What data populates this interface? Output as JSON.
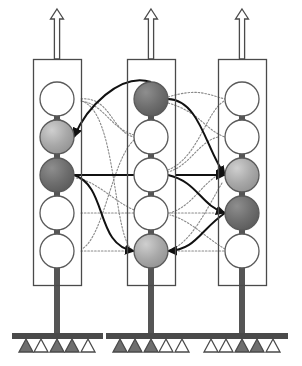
{
  "diagram": {
    "type": "node-network-diagram",
    "canvas": {
      "width": 302,
      "height": 366
    },
    "colors": {
      "outline": "#4a4a4a",
      "node_stroke": "#5a5a5a",
      "node_white": "#ffffff",
      "node_light_gray": "#a8a8a8",
      "node_dark_gray": "#6e6e6e",
      "stem": "#555555",
      "ground_bar": "#4a4a4a",
      "triangle_filled": "#6e6e6e",
      "triangle_empty": "#ffffff",
      "solid_link": "#111111",
      "dotted_link": "#8a8a8a",
      "background": "#ffffff"
    },
    "columns": [
      {
        "id": "column-1",
        "label": "left-column",
        "box": {
          "x": 33,
          "y": 59,
          "width": 48,
          "height": 226
        },
        "out_arrow": {
          "x": 57,
          "y_top": 9,
          "y_bottom": 59,
          "style": "hollow-up-arrow"
        },
        "stem": {
          "x": 57,
          "y_top": 84,
          "y_bottom": 333
        },
        "inner_arrow": {
          "x": 57,
          "y": 124,
          "direction": "up"
        },
        "nodes": [
          {
            "index": 0,
            "cy": 99,
            "fill": "white",
            "label": "c1-n1"
          },
          {
            "index": 1,
            "cy": 137,
            "fill": "light",
            "label": "c1-n2"
          },
          {
            "index": 2,
            "cy": 175,
            "fill": "dark",
            "label": "c1-n3"
          },
          {
            "index": 3,
            "cy": 213,
            "fill": "white",
            "label": "c1-n4"
          },
          {
            "index": 4,
            "cy": 251,
            "fill": "white",
            "label": "c1-n5"
          }
        ],
        "ground": {
          "bar_x": 12,
          "bar_y": 333,
          "bar_width": 91
        },
        "triangles": [
          {
            "index": 0,
            "cx": 26,
            "fill": "filled"
          },
          {
            "index": 1,
            "cx": 41,
            "fill": "empty"
          },
          {
            "index": 2,
            "cx": 57,
            "fill": "filled"
          },
          {
            "index": 3,
            "cx": 72,
            "fill": "filled"
          },
          {
            "index": 4,
            "cx": 88,
            "fill": "empty"
          }
        ]
      },
      {
        "id": "column-2",
        "label": "middle-column",
        "box": {
          "x": 127,
          "y": 59,
          "width": 48,
          "height": 226
        },
        "out_arrow": {
          "x": 151,
          "y_top": 9,
          "y_bottom": 59,
          "style": "hollow-up-arrow"
        },
        "stem": {
          "x": 151,
          "y_top": 84,
          "y_bottom": 333
        },
        "inner_arrow": {
          "x": 151,
          "y": 124,
          "direction": "up"
        },
        "nodes": [
          {
            "index": 0,
            "cy": 99,
            "fill": "dark",
            "label": "c2-n1"
          },
          {
            "index": 1,
            "cy": 137,
            "fill": "white",
            "label": "c2-n2"
          },
          {
            "index": 2,
            "cy": 175,
            "fill": "white",
            "label": "c2-n3"
          },
          {
            "index": 3,
            "cy": 213,
            "fill": "white",
            "label": "c2-n4"
          },
          {
            "index": 4,
            "cy": 251,
            "fill": "light",
            "label": "c2-n5"
          }
        ],
        "ground": {
          "bar_x": 106,
          "bar_y": 333,
          "bar_width": 91
        },
        "triangles": [
          {
            "index": 0,
            "cx": 120,
            "fill": "filled"
          },
          {
            "index": 1,
            "cx": 135,
            "fill": "filled"
          },
          {
            "index": 2,
            "cx": 151,
            "fill": "filled"
          },
          {
            "index": 3,
            "cx": 166,
            "fill": "empty"
          },
          {
            "index": 4,
            "cx": 182,
            "fill": "empty"
          }
        ]
      },
      {
        "id": "column-3",
        "label": "right-column",
        "box": {
          "x": 218,
          "y": 59,
          "width": 48,
          "height": 226
        },
        "out_arrow": {
          "x": 242,
          "y_top": 9,
          "y_bottom": 59,
          "style": "hollow-up-arrow"
        },
        "stem": {
          "x": 242,
          "y_top": 84,
          "y_bottom": 333
        },
        "inner_arrow": {
          "x": 242,
          "y": 124,
          "direction": "up"
        },
        "nodes": [
          {
            "index": 0,
            "cy": 99,
            "fill": "white",
            "label": "c3-n1"
          },
          {
            "index": 1,
            "cy": 137,
            "fill": "white",
            "label": "c3-n2"
          },
          {
            "index": 2,
            "cy": 175,
            "fill": "light",
            "label": "c3-n3"
          },
          {
            "index": 3,
            "cy": 213,
            "fill": "dark",
            "label": "c3-n4"
          },
          {
            "index": 4,
            "cy": 251,
            "fill": "white",
            "label": "c3-n5"
          }
        ],
        "ground": {
          "bar_x": 197,
          "bar_y": 333,
          "bar_width": 91
        },
        "triangles": [
          {
            "index": 0,
            "cx": 211,
            "fill": "empty"
          },
          {
            "index": 1,
            "cx": 226,
            "fill": "empty"
          },
          {
            "index": 2,
            "cx": 242,
            "fill": "filled"
          },
          {
            "index": 3,
            "cx": 257,
            "fill": "filled"
          },
          {
            "index": 4,
            "cx": 273,
            "fill": "empty"
          }
        ]
      }
    ],
    "node_radius": 17,
    "links": {
      "solid": [
        {
          "from": "c2-n1",
          "to": "c1-n2",
          "path": "M 151 82 C 120 72, 86 108, 74 137",
          "arrow": "end"
        },
        {
          "from": "c2-n1",
          "to": "c3-n3",
          "path": "M 168 99 C 200 100, 206 150, 225 175",
          "arrow": "end"
        },
        {
          "from": "c1-n3",
          "to": "c3-n3",
          "path": "M 175 175 L 225 175",
          "arrow": "end"
        },
        {
          "from": "c1-n3",
          "to": "c2-n5",
          "path": "M 74 175 C 108 186, 95 246, 134 251",
          "arrow": "end"
        },
        {
          "from": "c2-n3",
          "to": "c3-n4",
          "path": "M 168 175 C 198 182, 200 205, 225 213",
          "arrow": "end"
        },
        {
          "from": "c3-n4",
          "to": "c2-n5",
          "path": "M 225 213 C 200 230, 196 250, 168 251",
          "arrow": "end"
        },
        {
          "from": "c2-n3",
          "to": "c2-n2",
          "path": "M 151 158 L 151 140",
          "arrow": "end"
        },
        {
          "from": "c1-n3-bus",
          "to": "c2-n3",
          "path": "M 74 175 L 134 175",
          "arrow": "none"
        }
      ],
      "dotted": [
        {
          "from": "c1-n1",
          "to": "c2-n2",
          "path": "M 81 99 C 110 96, 112 132, 134 137"
        },
        {
          "from": "c1-n1",
          "to": "c2-n5",
          "path": "M 81 101 C 118 110, 112 242, 134 251"
        },
        {
          "from": "c2-n1",
          "to": "c3-n1",
          "path": "M 168 97 C 198 88, 206 94, 225 99"
        },
        {
          "from": "c2-n1",
          "to": "c3-n2",
          "path": "M 168 103 C 200 112, 205 130, 225 137"
        },
        {
          "from": "c1-n4",
          "to": "c2-n4",
          "path": "M 81 213 L 134 213"
        },
        {
          "from": "c1-n5",
          "to": "c2-n5",
          "path": "M 81 251 L 134 251"
        },
        {
          "from": "c2-n4",
          "to": "c3-n4",
          "path": "M 168 213 L 225 213"
        },
        {
          "from": "c2-n5",
          "to": "c3-n5",
          "path": "M 168 251 L 225 251"
        },
        {
          "from": "c3-n2",
          "to": "c2-n3",
          "path": "M 218 137 C 198 142, 190 166, 168 172"
        },
        {
          "from": "c3-n3",
          "to": "c2-n4",
          "path": "M 218 175 C 200 186, 192 206, 170 213"
        },
        {
          "from": "c2-n2",
          "to": "c1-n1",
          "path": "M 134 135 C 110 128, 104 104, 81 101"
        },
        {
          "from": "c2-n2",
          "to": "c1-n5",
          "path": "M 134 140 C 112 160, 104 236, 82 249"
        },
        {
          "from": "c2-n4",
          "to": "c1-n3",
          "path": "M 134 210 C 112 200, 98 182, 76 178"
        },
        {
          "from": "c3-n5",
          "to": "c2-n4",
          "path": "M 225 249 C 206 238, 190 220, 170 215"
        },
        {
          "from": "c3-n3",
          "to": "c2-n5",
          "path": "M 222 183 C 206 210, 192 242, 170 250"
        },
        {
          "from": "c2-n3",
          "to": "c3-n1",
          "path": "M 168 170 C 198 158, 206 112, 224 101"
        }
      ]
    }
  }
}
